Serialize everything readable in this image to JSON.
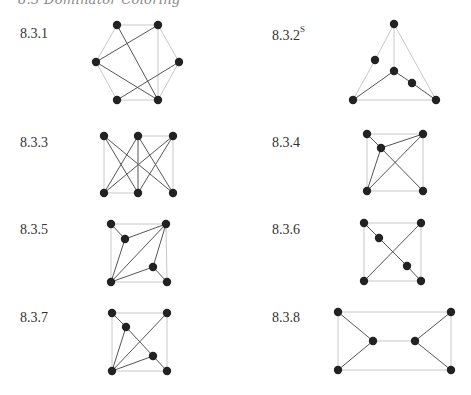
{
  "running_head": "8.3 Dominator Coloring",
  "exercises": [
    {
      "label": "8.3.1",
      "superscript": "",
      "pos": [
        20,
        26
      ],
      "vertices": [
        [
          117,
          25
        ],
        [
          158,
          25
        ],
        [
          96,
          62
        ],
        [
          179,
          62
        ],
        [
          117,
          100
        ],
        [
          158,
          100
        ]
      ],
      "light_edges": [
        [
          0,
          1
        ],
        [
          0,
          2
        ],
        [
          1,
          3
        ],
        [
          2,
          4
        ],
        [
          3,
          5
        ],
        [
          4,
          5
        ],
        [
          1,
          5
        ]
      ],
      "dark_edges": [
        [
          0,
          5
        ],
        [
          1,
          2
        ],
        [
          2,
          5
        ],
        [
          4,
          3
        ]
      ]
    },
    {
      "label": "8.3.2",
      "superscript": "S",
      "pos": [
        272,
        26
      ],
      "vertices": [
        [
          394,
          24
        ],
        [
          375,
          60
        ],
        [
          394,
          71
        ],
        [
          412,
          83
        ],
        [
          353,
          100
        ],
        [
          436,
          100
        ]
      ],
      "light_edges": [
        [
          0,
          1
        ],
        [
          1,
          4
        ],
        [
          0,
          2
        ],
        [
          0,
          5
        ],
        [
          4,
          5
        ]
      ],
      "dark_edges": [
        [
          2,
          4
        ],
        [
          2,
          3
        ],
        [
          3,
          5
        ]
      ]
    },
    {
      "label": "8.3.3",
      "superscript": "",
      "pos": [
        20,
        135
      ],
      "vertices": [
        [
          104,
          136
        ],
        [
          138,
          136
        ],
        [
          173,
          136
        ],
        [
          104,
          193
        ],
        [
          138,
          193
        ],
        [
          173,
          193
        ]
      ],
      "light_edges": [
        [
          0,
          3
        ],
        [
          2,
          5
        ],
        [
          1,
          2
        ],
        [
          3,
          4
        ]
      ],
      "dark_edges": [
        [
          0,
          4
        ],
        [
          0,
          5
        ],
        [
          1,
          3
        ],
        [
          1,
          5
        ],
        [
          2,
          3
        ],
        [
          2,
          4
        ],
        [
          1,
          4
        ]
      ]
    },
    {
      "label": "8.3.4",
      "superscript": "",
      "pos": [
        272,
        135
      ],
      "vertices": [
        [
          367,
          134
        ],
        [
          381,
          148
        ],
        [
          423,
          134
        ],
        [
          367,
          191
        ],
        [
          423,
          191
        ]
      ],
      "light_edges": [
        [
          0,
          2
        ],
        [
          0,
          3
        ],
        [
          2,
          4
        ],
        [
          3,
          4
        ]
      ],
      "dark_edges": [
        [
          0,
          1
        ],
        [
          1,
          2
        ],
        [
          1,
          3
        ],
        [
          1,
          4
        ],
        [
          2,
          3
        ]
      ]
    },
    {
      "label": "8.3.5",
      "superscript": "",
      "pos": [
        20,
        222
      ],
      "vertices": [
        [
          111,
          224
        ],
        [
          125,
          239
        ],
        [
          166,
          224
        ],
        [
          153,
          267
        ],
        [
          111,
          282
        ],
        [
          167,
          282
        ]
      ],
      "light_edges": [
        [
          0,
          2
        ],
        [
          0,
          4
        ],
        [
          2,
          5
        ],
        [
          4,
          5
        ]
      ],
      "dark_edges": [
        [
          0,
          1
        ],
        [
          1,
          2
        ],
        [
          1,
          4
        ],
        [
          2,
          4
        ],
        [
          2,
          3
        ],
        [
          3,
          4
        ],
        [
          3,
          5
        ]
      ]
    },
    {
      "label": "8.3.6",
      "superscript": "",
      "pos": [
        272,
        222
      ],
      "vertices": [
        [
          364,
          223
        ],
        [
          379,
          238
        ],
        [
          421,
          223
        ],
        [
          407,
          266
        ],
        [
          364,
          281
        ],
        [
          421,
          281
        ]
      ],
      "light_edges": [
        [
          0,
          2
        ],
        [
          0,
          4
        ],
        [
          2,
          5
        ],
        [
          4,
          5
        ]
      ],
      "dark_edges": [
        [
          0,
          1
        ],
        [
          1,
          3
        ],
        [
          3,
          5
        ],
        [
          2,
          4
        ]
      ]
    },
    {
      "label": "8.3.7",
      "superscript": "",
      "pos": [
        20,
        310
      ],
      "vertices": [
        [
          112,
          313
        ],
        [
          126,
          327
        ],
        [
          167,
          313
        ],
        [
          153,
          356
        ],
        [
          112,
          371
        ],
        [
          167,
          371
        ]
      ],
      "light_edges": [
        [
          0,
          2
        ],
        [
          0,
          4
        ],
        [
          2,
          5
        ],
        [
          4,
          5
        ]
      ],
      "dark_edges": [
        [
          0,
          1
        ],
        [
          1,
          4
        ],
        [
          1,
          3
        ],
        [
          3,
          5
        ],
        [
          3,
          4
        ],
        [
          2,
          4
        ]
      ]
    },
    {
      "label": "8.3.8",
      "superscript": "",
      "pos": [
        272,
        310
      ],
      "vertices": [
        [
          338,
          312
        ],
        [
          373,
          341
        ],
        [
          415,
          341
        ],
        [
          451,
          312
        ],
        [
          338,
          370
        ],
        [
          451,
          370
        ]
      ],
      "light_edges": [
        [
          1,
          2
        ],
        [
          0,
          3
        ],
        [
          4,
          5
        ],
        [
          0,
          4
        ],
        [
          3,
          5
        ]
      ],
      "dark_edges": [
        [
          0,
          1
        ],
        [
          4,
          1
        ],
        [
          3,
          2
        ],
        [
          5,
          2
        ]
      ]
    }
  ]
}
